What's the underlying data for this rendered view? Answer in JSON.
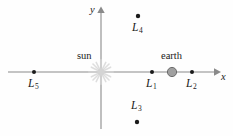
{
  "figure": {
    "type": "diagram",
    "background_color": "#fefefe",
    "axis_color": "#8a8a8a",
    "point_color": "#1a1a1a",
    "earth_color": "#a0a0a0",
    "sun_color": "#d4d4d4"
  },
  "axes": {
    "x_label": "x",
    "y_label": "y",
    "origin": {
      "x": 101,
      "y": 72
    }
  },
  "bodies": [
    {
      "id": "sun",
      "label": "sun",
      "icon": "sun-starburst-icon",
      "cx": 101,
      "cy": 72,
      "label_x": 77,
      "label_y": 51
    },
    {
      "id": "earth",
      "label": "earth",
      "icon": "earth-sphere-icon",
      "cx": 172,
      "cy": 72,
      "label_x": 161,
      "label_y": 51
    }
  ],
  "lagrange_points": [
    {
      "id": "L1",
      "letter": "L",
      "subscript": "1",
      "cx": 152,
      "cy": 72,
      "label_x": 146,
      "label_y": 78
    },
    {
      "id": "L2",
      "letter": "L",
      "subscript": "2",
      "cx": 192,
      "cy": 72,
      "label_x": 186,
      "label_y": 78
    },
    {
      "id": "L3",
      "letter": "L",
      "subscript": "3",
      "cx": 137,
      "cy": 122,
      "label_x": 131,
      "label_y": 100
    },
    {
      "id": "L4",
      "letter": "L",
      "subscript": "4",
      "cx": 138,
      "cy": 16,
      "label_x": 132,
      "label_y": 22
    },
    {
      "id": "L5",
      "letter": "L",
      "subscript": "5",
      "cx": 34,
      "cy": 72,
      "label_x": 28,
      "label_y": 78
    }
  ]
}
